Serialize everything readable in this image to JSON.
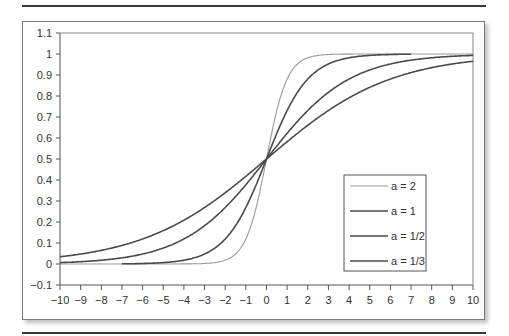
{
  "chart_data": {
    "type": "line",
    "title": "",
    "xlabel": "",
    "ylabel": "",
    "xlim": [
      -10,
      10
    ],
    "ylim": [
      -0.1,
      1.1
    ],
    "grid": false,
    "legend_position": "inside lower right",
    "x_ticks": [
      "-10",
      "-9",
      "-8",
      "-7",
      "-6",
      "-5",
      "-4",
      "-3",
      "-2",
      "-1",
      "0",
      "1",
      "2",
      "3",
      "4",
      "5",
      "6",
      "7",
      "8",
      "9",
      "10"
    ],
    "y_ticks": [
      "1.1",
      "1",
      "0.9",
      "0.8",
      "0.7",
      "0.6",
      "0.5",
      "0.4",
      "0.3",
      "0.2",
      "0.1",
      "0",
      "-0.1"
    ],
    "function": "y = 1 / (1 + exp(-a x))",
    "series": [
      {
        "name": "a = 2",
        "a": 2,
        "x_range": [
          -10,
          10
        ],
        "color": "#9a9a9a",
        "width": 1.1,
        "sample_points": {
          "x": [
            -10,
            -2,
            -1,
            0,
            1,
            2,
            10
          ],
          "y": [
            0.0,
            0.02,
            0.12,
            0.5,
            0.88,
            0.98,
            1.0
          ]
        }
      },
      {
        "name": "a = 1",
        "a": 1,
        "x_range": [
          -7,
          7
        ],
        "color": "#4a4a4a",
        "width": 1.6,
        "sample_points": {
          "x": [
            -7,
            -4,
            -2,
            0,
            2,
            4,
            7
          ],
          "y": [
            0.0,
            0.02,
            0.12,
            0.5,
            0.88,
            0.98,
            1.0
          ]
        }
      },
      {
        "name": "a = 1/2",
        "a": 0.5,
        "x_range": [
          -10,
          10
        ],
        "color": "#4a4a4a",
        "width": 1.6,
        "sample_points": {
          "x": [
            -10,
            -5,
            -2,
            0,
            2,
            5,
            10
          ],
          "y": [
            0.01,
            0.08,
            0.27,
            0.5,
            0.73,
            0.92,
            0.99
          ]
        }
      },
      {
        "name": "a = 1/3",
        "a": 0.3333,
        "x_range": [
          -10,
          10
        ],
        "color": "#4a4a4a",
        "width": 1.6,
        "sample_points": {
          "x": [
            -10,
            -5,
            -2,
            0,
            2,
            5,
            10
          ],
          "y": [
            0.03,
            0.16,
            0.34,
            0.5,
            0.66,
            0.84,
            0.97
          ]
        }
      }
    ]
  }
}
